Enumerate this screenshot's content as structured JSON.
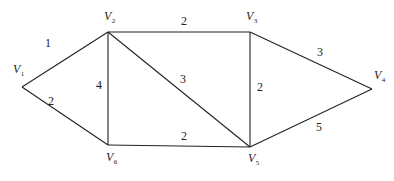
{
  "diagram": {
    "type": "weighted-undirected-graph",
    "colors": {
      "stroke": "#222222",
      "background": "#ffffff"
    },
    "vertices": [
      {
        "id": "V1",
        "letter": "V",
        "sub": "1",
        "x": 22,
        "y": 87,
        "label_x": 13,
        "label_y": 73
      },
      {
        "id": "V2",
        "letter": "V",
        "sub": "2",
        "x": 108,
        "y": 32,
        "label_x": 104,
        "label_y": 20
      },
      {
        "id": "V3",
        "letter": "V",
        "sub": "3",
        "x": 250,
        "y": 32,
        "label_x": 246,
        "label_y": 20
      },
      {
        "id": "V4",
        "letter": "V",
        "sub": "4",
        "x": 372,
        "y": 89,
        "label_x": 374,
        "label_y": 79
      },
      {
        "id": "V5",
        "letter": "V",
        "sub": "5",
        "x": 250,
        "y": 147,
        "label_x": 248,
        "label_y": 162
      },
      {
        "id": "V6",
        "letter": "V",
        "sub": "6",
        "x": 108,
        "y": 145,
        "label_x": 106,
        "label_y": 161
      }
    ],
    "edges": [
      {
        "from": "V1",
        "to": "V2",
        "weight": "1",
        "wx": 45,
        "wy": 47
      },
      {
        "from": "V1",
        "to": "V6",
        "weight": "2",
        "wx": 48,
        "wy": 105
      },
      {
        "from": "V2",
        "to": "V3",
        "weight": "2",
        "wx": 181,
        "wy": 25
      },
      {
        "from": "V2",
        "to": "V6",
        "weight": "4",
        "wx": 96,
        "wy": 89
      },
      {
        "from": "V2",
        "to": "V5",
        "weight": "3",
        "wx": 180,
        "wy": 83
      },
      {
        "from": "V3",
        "to": "V5",
        "weight": "2",
        "wx": 257,
        "wy": 91
      },
      {
        "from": "V3",
        "to": "V4",
        "weight": "3",
        "wx": 317,
        "wy": 56
      },
      {
        "from": "V6",
        "to": "V5",
        "weight": "2",
        "wx": 181,
        "wy": 140
      },
      {
        "from": "V5",
        "to": "V4",
        "weight": "5",
        "wx": 316,
        "wy": 131
      }
    ]
  }
}
